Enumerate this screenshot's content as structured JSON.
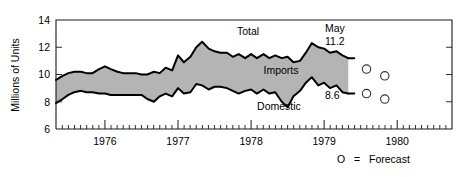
{
  "chart_data": {
    "type": "area",
    "title": "",
    "xlabel": "",
    "ylabel": "Millions of Units",
    "ylim": [
      6,
      14
    ],
    "xlim": [
      1975.33,
      1980.75
    ],
    "grid": false,
    "legend_position": "below-right",
    "y_ticks": [
      "6",
      "8",
      "10",
      "12",
      "14"
    ],
    "y_tick_values": [
      6,
      8,
      10,
      12,
      14
    ],
    "x_ticks": [
      "1976",
      "1977",
      "1978",
      "1979",
      "1980"
    ],
    "x_tick_values": [
      1976,
      1977,
      1978,
      1979,
      1980
    ],
    "minor_tick_interval_months": 1,
    "series": [
      {
        "name": "Total",
        "label": "Total",
        "description": "Upper boundary of shaded band; total units",
        "x": [
          1975.33,
          1975.42,
          1975.5,
          1975.58,
          1975.67,
          1975.75,
          1975.83,
          1975.92,
          1976.0,
          1976.08,
          1976.17,
          1976.25,
          1976.33,
          1976.42,
          1976.5,
          1976.58,
          1976.67,
          1976.75,
          1976.83,
          1976.92,
          1977.0,
          1977.08,
          1977.17,
          1977.25,
          1977.33,
          1977.42,
          1977.5,
          1977.58,
          1977.67,
          1977.75,
          1977.83,
          1977.92,
          1978.0,
          1978.08,
          1978.17,
          1978.25,
          1978.33,
          1978.42,
          1978.5,
          1978.58,
          1978.67,
          1978.75,
          1978.83,
          1978.92,
          1979.0,
          1979.08,
          1979.17,
          1979.25,
          1979.33
        ],
        "values": [
          9.6,
          9.9,
          10.1,
          10.2,
          10.2,
          10.1,
          10.1,
          10.4,
          10.6,
          10.4,
          10.2,
          10.1,
          10.1,
          10.1,
          10.0,
          10.0,
          10.2,
          10.1,
          10.5,
          10.3,
          11.4,
          10.9,
          11.3,
          12.0,
          12.4,
          11.9,
          11.7,
          11.6,
          11.6,
          11.3,
          11.5,
          11.2,
          11.5,
          11.2,
          11.5,
          11.2,
          11.4,
          11.2,
          11.3,
          10.9,
          11.0,
          11.6,
          12.3,
          12.0,
          11.9,
          11.6,
          11.7,
          11.4,
          11.2
        ]
      },
      {
        "name": "Domestic",
        "label": "Domestic",
        "description": "Lower boundary of shaded band; domestic units",
        "x": [
          1975.33,
          1975.42,
          1975.5,
          1975.58,
          1975.67,
          1975.75,
          1975.83,
          1975.92,
          1976.0,
          1976.08,
          1976.17,
          1976.25,
          1976.33,
          1976.42,
          1976.5,
          1976.58,
          1976.67,
          1976.75,
          1976.83,
          1976.92,
          1977.0,
          1977.08,
          1977.17,
          1977.25,
          1977.33,
          1977.42,
          1977.5,
          1977.58,
          1977.67,
          1977.75,
          1977.83,
          1977.92,
          1978.0,
          1978.08,
          1978.17,
          1978.25,
          1978.33,
          1978.42,
          1978.5,
          1978.58,
          1978.67,
          1978.75,
          1978.83,
          1978.92,
          1979.0,
          1979.08,
          1979.17,
          1979.25,
          1979.33
        ],
        "values": [
          7.9,
          8.2,
          8.5,
          8.7,
          8.8,
          8.7,
          8.7,
          8.6,
          8.6,
          8.5,
          8.5,
          8.5,
          8.5,
          8.5,
          8.5,
          8.2,
          8.0,
          8.4,
          8.6,
          8.4,
          9.0,
          8.6,
          8.7,
          9.3,
          9.2,
          8.9,
          9.1,
          9.1,
          9.0,
          8.8,
          8.6,
          8.8,
          8.9,
          8.6,
          8.9,
          8.6,
          8.7,
          8.0,
          7.6,
          8.4,
          8.8,
          9.4,
          9.8,
          9.2,
          9.4,
          9.0,
          9.2,
          8.7,
          8.6
        ]
      }
    ],
    "band_label": "Imports",
    "band_description": "Shaded region between Total and Domestic represents Imports",
    "annotations": [
      {
        "id": "may-label",
        "text": "May",
        "x": 1979.33,
        "y": 11.2
      },
      {
        "id": "total-value",
        "text": "11.2",
        "x": 1979.33,
        "y": 11.2
      },
      {
        "id": "domestic-value",
        "text": "8.6",
        "x": 1979.33,
        "y": 8.6
      }
    ],
    "forecast": {
      "marker_glyph": "O",
      "legend_text": "O  =  Forecast",
      "legend_symbol": "O",
      "legend_equals": "=",
      "legend_word": "Forecast",
      "points": [
        {
          "x": 1979.58,
          "y": 10.4
        },
        {
          "x": 1979.58,
          "y": 8.6
        },
        {
          "x": 1979.83,
          "y": 9.9
        },
        {
          "x": 1979.83,
          "y": 8.2
        }
      ]
    },
    "colors": {
      "band_fill": "#b4b4b4",
      "line": "#000000",
      "axis": "#1a1a1a",
      "background": "#ffffff",
      "marker_stroke": "#333333"
    }
  }
}
